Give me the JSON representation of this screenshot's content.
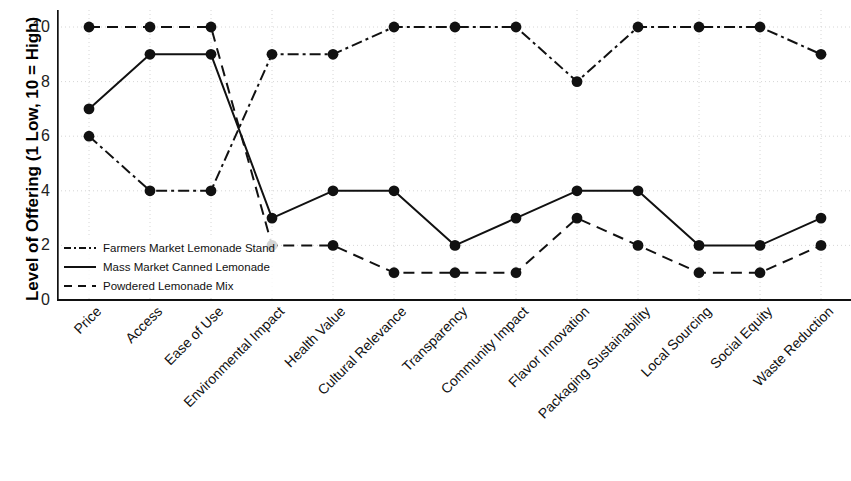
{
  "chart_data": {
    "type": "line",
    "title": "",
    "xlabel": "",
    "ylabel": "Level of Offering (1 Low, 10 = High)",
    "ylim": [
      0,
      10
    ],
    "yticks": [
      0,
      2,
      4,
      6,
      8,
      10
    ],
    "grid": true,
    "legend_position": "lower left (inside axes)",
    "categories": [
      "Price",
      "Access",
      "Ease of Use",
      "Environmental Impact",
      "Health Value",
      "Cultural Relevance",
      "Transparency",
      "Community Impact",
      "Flavor Innovation",
      "Packaging Sustainability",
      "Local Sourcing",
      "Social Equity",
      "Waste Reduction"
    ],
    "series": [
      {
        "name": "Farmers Market Lemonade Stand",
        "style": "dashdot",
        "color": "#111111",
        "values": [
          6,
          4,
          4,
          9,
          9,
          10,
          10,
          10,
          8,
          10,
          10,
          10,
          9
        ]
      },
      {
        "name": "Mass Market Canned Lemonade",
        "style": "solid",
        "color": "#111111",
        "values": [
          7,
          9,
          9,
          3,
          4,
          4,
          2,
          3,
          4,
          4,
          2,
          2,
          3
        ]
      },
      {
        "name": "Powdered Lemonade Mix",
        "style": "dashed",
        "color": "#111111",
        "values": [
          10,
          10,
          10,
          2,
          2,
          1,
          1,
          1,
          3,
          2,
          1,
          1,
          2
        ]
      }
    ]
  }
}
